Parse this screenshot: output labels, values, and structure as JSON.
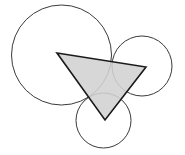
{
  "figure": {
    "width": 185,
    "height": 155,
    "background_color": "#ffffff",
    "circle_stroke_color": "#3a3a3a",
    "circle_stroke_width": 1,
    "circle_fill": "none",
    "triangle_fill_color": "#d2d2d2",
    "triangle_stroke_color": "#1a1a1a",
    "triangle_stroke_width": 1.6,
    "circles": [
      {
        "name": "large-left-circle",
        "label": "Large circle (upper left)",
        "cx": 61.5,
        "cy": 55,
        "r": 50
      },
      {
        "name": "medium-right-circle",
        "label": "Medium circle (upper right)",
        "cx": 142,
        "cy": 66,
        "r": 30
      },
      {
        "name": "small-bottom-circle",
        "label": "Small circle (bottom center)",
        "cx": 103.5,
        "cy": 120.5,
        "r": 27.5
      }
    ],
    "triangle": {
      "name": "shaded-triangle",
      "label": "Inverted shaded triangle",
      "points": "57,53 146,67 105,120",
      "vertices": [
        {
          "name": "vertex-top-left",
          "x": 57,
          "y": 53
        },
        {
          "name": "vertex-top-right",
          "x": 146,
          "y": 67
        },
        {
          "name": "vertex-bottom",
          "x": 105,
          "y": 120
        }
      ]
    }
  }
}
